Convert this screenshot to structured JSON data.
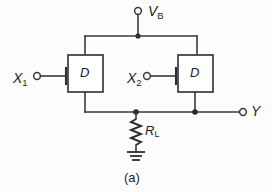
{
  "figure": {
    "caption": "(a)",
    "type": "circuit-schematic"
  },
  "terminals": {
    "bias": {
      "label_main": "V",
      "label_sub": "B",
      "name": "V_B",
      "role": "supply-terminal"
    },
    "input1": {
      "label_main": "X",
      "label_sub": "1",
      "name": "X_1",
      "role": "input-terminal"
    },
    "input2": {
      "label_main": "X",
      "label_sub": "2",
      "name": "X_2",
      "role": "input-terminal"
    },
    "output": {
      "label_main": "Y",
      "label_sub": "",
      "name": "Y",
      "role": "output-terminal"
    }
  },
  "components": {
    "diode1": {
      "label": "D",
      "kind": "diode-box"
    },
    "diode2": {
      "label": "D",
      "kind": "diode-box"
    },
    "resistor": {
      "label_main": "R",
      "label_sub": "L",
      "name": "R_L",
      "kind": "load-resistor"
    },
    "ground": {
      "kind": "ground-symbol",
      "bars": 3
    }
  },
  "colors": {
    "background": "#fdfdfd",
    "wire": "#3a3a3a",
    "text": "#1d1d1d",
    "junction": "#2a2a2a"
  }
}
